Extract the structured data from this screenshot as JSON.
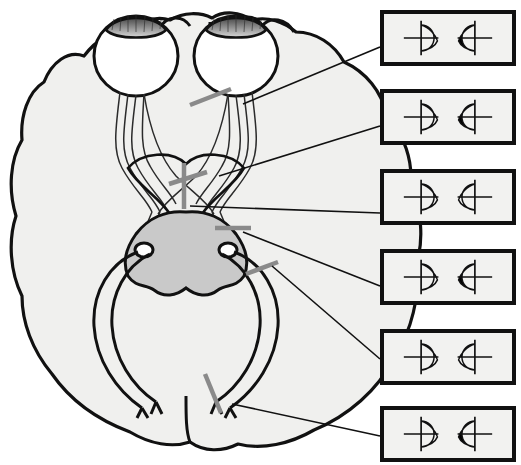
{
  "figure": {
    "view": "axial (horizontal) section of brain viewed from below",
    "width": 521,
    "height": 465
  },
  "colors": {
    "outline": "#111111",
    "brain_fill": "#f0f0ee",
    "brainstem_fill": "#c9c9c9",
    "lesion_mark": "#8a8a8a",
    "field_defect": "#000000",
    "field_background": "#f2f2f0",
    "box_border": "#111111",
    "leader_line": "#111111",
    "page_background": "#ffffff"
  },
  "anatomy": {
    "parts": [
      {
        "name": "left-eye",
        "label": "Left eye"
      },
      {
        "name": "right-eye",
        "label": "Right eye"
      },
      {
        "name": "left-optic-nerve",
        "label": "Left optic nerve"
      },
      {
        "name": "right-optic-nerve",
        "label": "Right optic nerve"
      },
      {
        "name": "optic-chiasm",
        "label": "Optic chiasm"
      },
      {
        "name": "left-optic-tract",
        "label": "Left optic tract"
      },
      {
        "name": "right-optic-tract",
        "label": "Right optic tract"
      },
      {
        "name": "lateral-geniculate-nucleus",
        "label": "Lateral geniculate nucleus"
      },
      {
        "name": "optic-radiation",
        "label": "Optic radiation"
      },
      {
        "name": "brainstem",
        "label": "Brainstem / midbrain"
      },
      {
        "name": "occipital-cortex",
        "label": "Occipital visual cortex"
      }
    ]
  },
  "lesions": [
    {
      "id": 1,
      "name": "lesion-optic-nerve",
      "site": "Right optic nerve",
      "x": 210,
      "y": 97,
      "angle": -22,
      "length": 44
    },
    {
      "id": 2,
      "name": "lesion-chiasm-lateral",
      "site": "Lateral optic chiasm",
      "x": 188,
      "y": 178,
      "angle": -18,
      "length": 40
    },
    {
      "id": 3,
      "name": "lesion-chiasm-midline",
      "site": "Midline optic chiasm",
      "x": 184,
      "y": 186,
      "angle": 90,
      "length": 46
    },
    {
      "id": 4,
      "name": "lesion-optic-tract",
      "site": "Right optic tract",
      "x": 233,
      "y": 228,
      "angle": 0,
      "length": 36
    },
    {
      "id": 5,
      "name": "lesion-optic-radiation",
      "site": "Temporal (Meyer) radiation",
      "x": 262,
      "y": 268,
      "angle": -20,
      "length": 34
    },
    {
      "id": 6,
      "name": "lesion-occipital-cortex",
      "site": "Occipital visual cortex",
      "x": 213,
      "y": 393,
      "angle": 68,
      "length": 42
    }
  ],
  "field_boxes": [
    {
      "id": 1,
      "name": "field-box-optic-nerve",
      "diagnosis": "Total blindness of the right eye",
      "lesion_ref": 1,
      "box": {
        "x": 380,
        "y": 10,
        "w": 136,
        "h": 56
      },
      "leader": {
        "x1": 243,
        "y1": 104,
        "x2": 380,
        "y2": 47
      },
      "left_field": {
        "shape": "left-eye-field",
        "defect": "none",
        "macular_sparing": false
      },
      "right_field": {
        "shape": "right-eye-field",
        "defect": "total",
        "macular_sparing": false
      }
    },
    {
      "id": 2,
      "name": "field-box-chiasm-lateral",
      "diagnosis": "Right nasal hemianopia",
      "lesion_ref": 2,
      "box": {
        "x": 380,
        "y": 89,
        "w": 136,
        "h": 56
      },
      "leader": {
        "x1": 219,
        "y1": 176,
        "x2": 380,
        "y2": 126
      },
      "left_field": {
        "shape": "left-eye-field",
        "defect": "left-half",
        "macular_sparing": false
      },
      "right_field": {
        "shape": "right-eye-field",
        "defect": "total",
        "macular_sparing": false
      }
    },
    {
      "id": 3,
      "name": "field-box-chiasm-midline",
      "diagnosis": "Bitemporal hemianopia",
      "lesion_ref": 3,
      "box": {
        "x": 380,
        "y": 169,
        "w": 136,
        "h": 56
      },
      "leader": {
        "x1": 190,
        "y1": 206,
        "x2": 380,
        "y2": 213
      },
      "left_field": {
        "shape": "left-eye-field",
        "defect": "left-half",
        "macular_sparing": false
      },
      "right_field": {
        "shape": "right-eye-field",
        "defect": "right-half",
        "macular_sparing": false
      }
    },
    {
      "id": 4,
      "name": "field-box-optic-tract",
      "diagnosis": "Left homonymous hemianopia",
      "lesion_ref": 4,
      "box": {
        "x": 380,
        "y": 249,
        "w": 136,
        "h": 56
      },
      "leader": {
        "x1": 243,
        "y1": 232,
        "x2": 380,
        "y2": 286
      },
      "left_field": {
        "shape": "left-eye-field",
        "defect": "left-half",
        "macular_sparing": false
      },
      "right_field": {
        "shape": "right-eye-field",
        "defect": "left-half",
        "macular_sparing": false
      }
    },
    {
      "id": 5,
      "name": "field-box-optic-radiation",
      "diagnosis": "Left superior homonymous quadrantanopia",
      "lesion_ref": 5,
      "box": {
        "x": 380,
        "y": 329,
        "w": 136,
        "h": 56
      },
      "leader": {
        "x1": 272,
        "y1": 266,
        "x2": 380,
        "y2": 359
      },
      "left_field": {
        "shape": "left-eye-field",
        "defect": "upper-left-quadrant",
        "macular_sparing": false
      },
      "right_field": {
        "shape": "right-eye-field",
        "defect": "upper-left-quadrant",
        "macular_sparing": false
      }
    },
    {
      "id": 6,
      "name": "field-box-occipital-cortex",
      "diagnosis": "Left homonymous hemianopia with macular sparing",
      "lesion_ref": 6,
      "box": {
        "x": 380,
        "y": 406,
        "w": 136,
        "h": 56
      },
      "leader": {
        "x1": 232,
        "y1": 404,
        "x2": 380,
        "y2": 436
      },
      "left_field": {
        "shape": "left-eye-field",
        "defect": "left-half",
        "macular_sparing": true
      },
      "right_field": {
        "shape": "right-eye-field",
        "defect": "left-half",
        "macular_sparing": true
      }
    }
  ]
}
